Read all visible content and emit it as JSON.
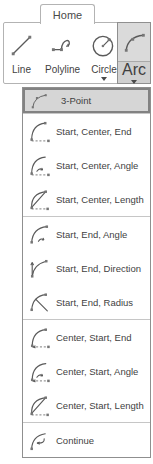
{
  "tab": {
    "label": "Home"
  },
  "ribbon": {
    "tools": [
      {
        "label": "Line",
        "icon": "line-icon",
        "has_dropdown": false,
        "active": false
      },
      {
        "label": "Polyline",
        "icon": "polyline-icon",
        "has_dropdown": false,
        "active": false
      },
      {
        "label": "Circle",
        "icon": "circle-icon",
        "has_dropdown": true,
        "active": false
      },
      {
        "label": "Arc",
        "icon": "arc-icon",
        "has_dropdown": true,
        "active": true
      }
    ]
  },
  "menu": {
    "selected_item": "3-Point",
    "items": [
      {
        "label": "3-Point",
        "icon": "arc-3-point-icon",
        "selected": true,
        "group": 1
      },
      {
        "label": "Start, Center, End",
        "icon": "arc-start-center-end-icon",
        "selected": false,
        "group": 2
      },
      {
        "label": "Start, Center, Angle",
        "icon": "arc-start-center-angle-icon",
        "selected": false,
        "group": 2
      },
      {
        "label": "Start, Center, Length",
        "icon": "arc-start-center-length-icon",
        "selected": false,
        "group": 2
      },
      {
        "label": "Start, End, Angle",
        "icon": "arc-start-end-angle-icon",
        "selected": false,
        "group": 3
      },
      {
        "label": "Start, End, Direction",
        "icon": "arc-start-end-direction-icon",
        "selected": false,
        "group": 3
      },
      {
        "label": "Start, End, Radius",
        "icon": "arc-start-end-radius-icon",
        "selected": false,
        "group": 3
      },
      {
        "label": "Center, Start, End",
        "icon": "arc-center-start-end-icon",
        "selected": false,
        "group": 4
      },
      {
        "label": "Center, Start, Angle",
        "icon": "arc-center-start-angle-icon",
        "selected": false,
        "group": 4
      },
      {
        "label": "Center, Start, Length",
        "icon": "arc-center-start-length-icon",
        "selected": false,
        "group": 4
      },
      {
        "label": "Continue",
        "icon": "arc-continue-icon",
        "selected": false,
        "group": 5
      }
    ]
  },
  "colors": {
    "highlight_bg": "#d6d6d6",
    "highlight_border": "#828282",
    "panel_border": "#b3b3b3",
    "menu_border": "#8f8f8f",
    "separator": "#c6c6c6",
    "text": "#3f3f3f",
    "icon_stroke": "#5a5a5a",
    "icon_point": "#767676"
  }
}
